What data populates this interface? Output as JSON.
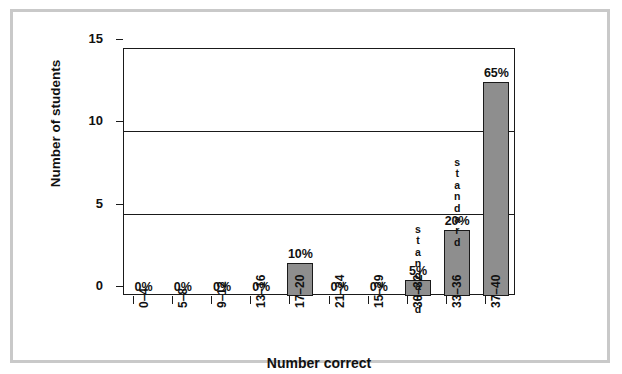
{
  "chart_data": {
    "type": "bar",
    "title": "",
    "xlabel": "Number correct",
    "ylabel": "Number of students",
    "categories": [
      "0–4",
      "5–8",
      "9–12",
      "13–16",
      "17–20",
      "21–24",
      "15–29",
      "30–32",
      "33–36",
      "37–40"
    ],
    "values": [
      0,
      0,
      0,
      0,
      2,
      0,
      0,
      1,
      4,
      13
    ],
    "data_labels": [
      "0%",
      "0%",
      "0%",
      "0%",
      "10%",
      "0%",
      "0%",
      "5%",
      "20%",
      "65%"
    ],
    "ylim": [
      0,
      15
    ],
    "yticks": [
      0,
      5,
      10,
      15
    ],
    "ytick_labels": [
      "0",
      "5",
      "10",
      "15"
    ],
    "grid": "horizontal gridlines at 5, 10, 15",
    "legend": null,
    "annotations": [
      {
        "text": "standard",
        "near_category": "30–32",
        "orientation": "vertical-stacked-letters"
      },
      {
        "text": "standard",
        "near_category": "33–36",
        "orientation": "vertical-stacked-letters"
      }
    ],
    "bar_color": "#8e8e8e",
    "bar_border_color": "#1a1a1a",
    "axis_color": "#1a1a1a"
  },
  "frame": {
    "border_color": "#c9c9c9",
    "background": "#ffffff"
  }
}
